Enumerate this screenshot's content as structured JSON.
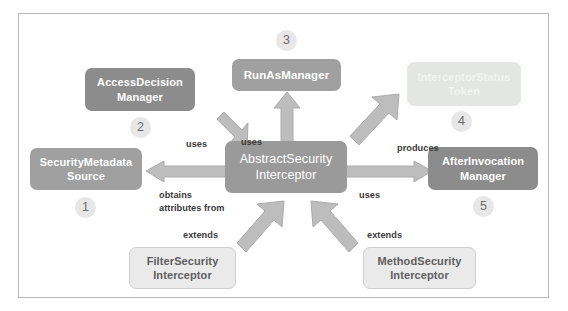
{
  "diagram": {
    "frame_border_color": "#b9b9b9",
    "background": "#ffffff",
    "arrow_color": "#bdbdbd",
    "nodes": [
      {
        "id": "security-metadata-source",
        "label": "SecurityMetadata\nSource",
        "badge": "1",
        "style": "mid"
      },
      {
        "id": "access-decision-manager",
        "label": "AccessDecision\nManager",
        "badge": "2",
        "style": "dark"
      },
      {
        "id": "run-as-manager",
        "label": "RunAsManager",
        "badge": "3",
        "style": "mid"
      },
      {
        "id": "interceptor-status-token",
        "label": "InterceptorStatus\nToken",
        "badge": "4",
        "style": "faded"
      },
      {
        "id": "after-invocation-manager",
        "label": "AfterInvocation\nManager",
        "badge": "5",
        "style": "dark"
      },
      {
        "id": "abstract-security-interceptor",
        "label": "AbstractSecurity\nInterceptor",
        "badge": "",
        "style": "center"
      },
      {
        "id": "filter-security-interceptor",
        "label": "FilterSecurity\nInterceptor",
        "badge": "",
        "style": "light"
      },
      {
        "id": "method-security-interceptor",
        "label": "MethodSecurity\nInterceptor",
        "badge": "",
        "style": "light"
      }
    ],
    "edges": [
      {
        "id": "edge-uses-access-decision-manager",
        "label": "uses"
      },
      {
        "id": "edge-uses-run-as-manager",
        "label": "uses"
      },
      {
        "id": "edge-produces-interceptor-status-token",
        "label": "produces"
      },
      {
        "id": "edge-obtains-attributes-from",
        "label": "obtains\nattributes from"
      },
      {
        "id": "edge-uses-after-invocation-manager",
        "label": "uses"
      },
      {
        "id": "edge-extends-filter-security-interceptor",
        "label": "extends"
      },
      {
        "id": "edge-extends-method-security-interceptor",
        "label": "extends"
      }
    ]
  }
}
